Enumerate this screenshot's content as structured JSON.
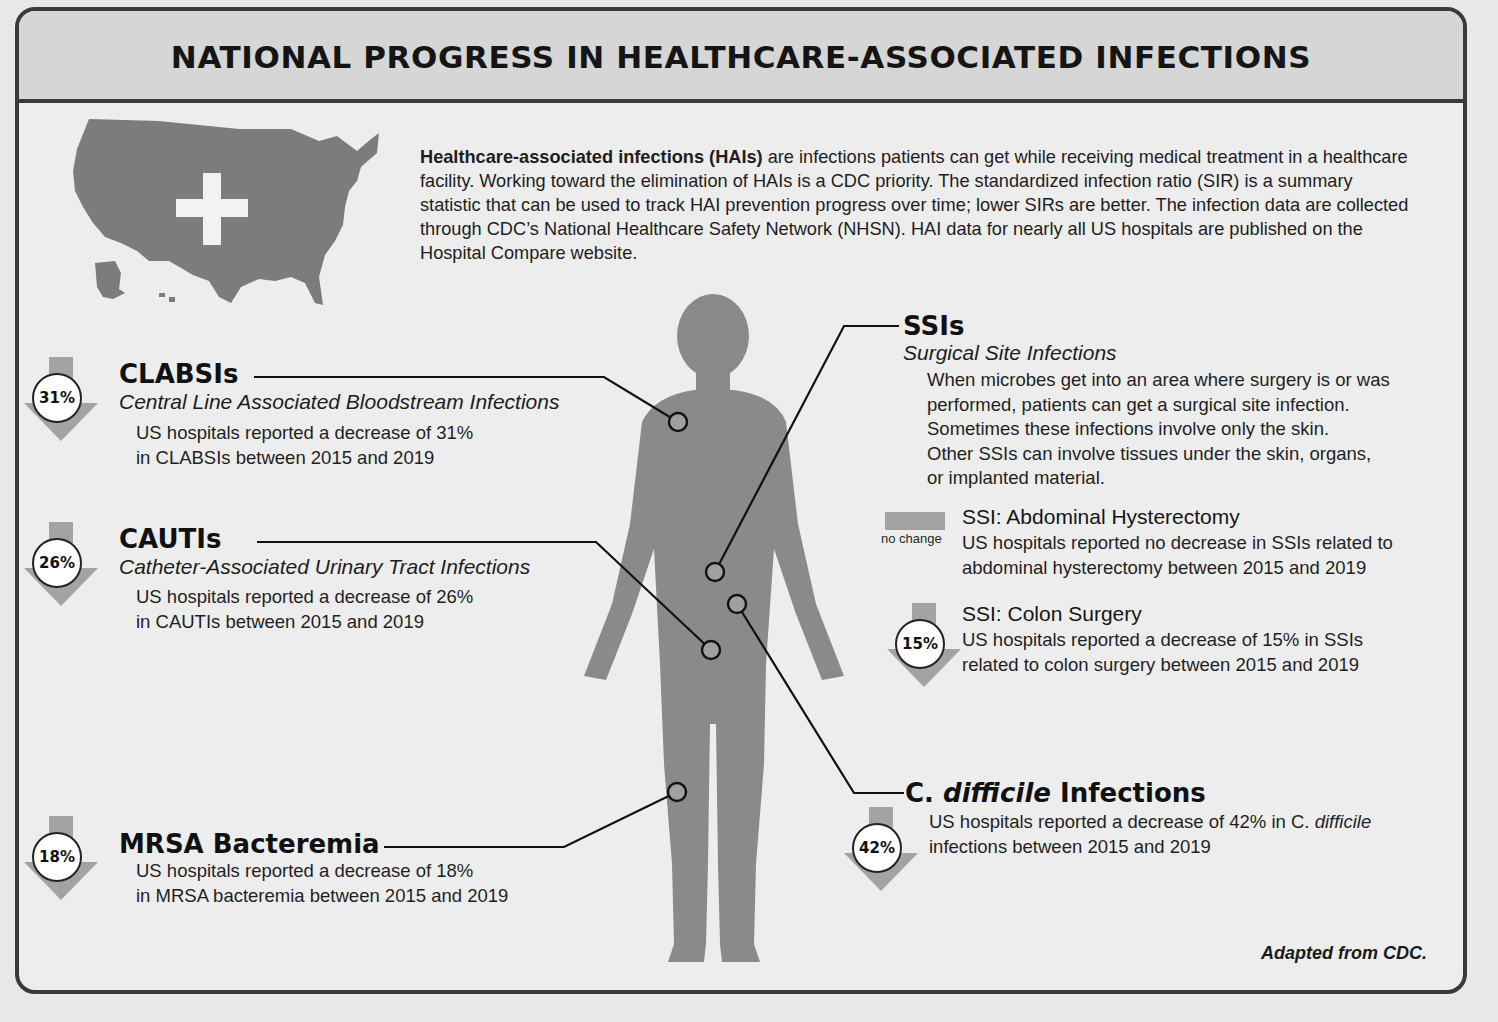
{
  "header": {
    "title": "NATIONAL PROGRESS IN HEALTHCARE-ASSOCIATED INFECTIONS"
  },
  "intro": {
    "lead_bold": "Healthcare-associated infections (HAIs)",
    "text": " are infections patients can get while receiving medical treatment in a healthcare facility. Working toward the elimination of HAIs is a CDC priority. The standardized infection ratio (SIR) is a summary statistic that can be used to track HAI prevention progress over time; lower SIRs are better. The infection data are collected through CDC’s National Healthcare Safety Network (NHSN). HAI data for nearly all US hospitals are published on the Hospital Compare website."
  },
  "icons": {
    "map": "us-map-with-cross",
    "body": "human-silhouette",
    "decrease": "down-arrow",
    "no_change": "flat-bar"
  },
  "colors": {
    "frame": "#3a3a3a",
    "header_bg": "#d6d6d6",
    "panel_bg": "#ededed",
    "silhouette": "#8a8a8a",
    "arrow": "#a3a3a3",
    "text": "#1a1a1a"
  },
  "sections": {
    "clabsi": {
      "badge": "31%",
      "title": "CLABSIs",
      "subtitle": "Central Line Associated Bloodstream Infections",
      "body_line1": "US hospitals reported a decrease of 31%",
      "body_line2": "in CLABSIs between 2015 and 2019"
    },
    "cauti": {
      "badge": "26%",
      "title": "CAUTIs",
      "subtitle": "Catheter-Associated Urinary Tract Infections",
      "body_line1": "US hospitals reported a decrease of 26%",
      "body_line2": "in CAUTIs between 2015 and 2019"
    },
    "mrsa": {
      "badge": "18%",
      "title": "MRSA Bacteremia",
      "body_line1": "US hospitals reported a decrease of 18%",
      "body_line2": "in MRSA bacteremia between 2015 and 2019"
    },
    "ssi": {
      "title": "SSIs",
      "subtitle": "Surgical Site Infections",
      "body_lines": [
        "When microbes get into an area where surgery is or was",
        "performed, patients can get a surgical site infection.",
        "Sometimes these infections involve only the skin.",
        "Other SSIs can involve tissues under the skin, organs,",
        "or implanted material."
      ],
      "hysterectomy": {
        "badge": "no change",
        "title": "SSI: Abdominal Hysterectomy",
        "body_line1": "US hospitals reported no decrease in SSIs related to",
        "body_line2": "abdominal hysterectomy between 2015 and 2019"
      },
      "colon": {
        "badge": "15%",
        "title": "SSI: Colon Surgery",
        "body_line1": "US hospitals reported a decrease of 15% in SSIs",
        "body_line2": "related to colon surgery between 2015 and 2019"
      }
    },
    "cdiff": {
      "badge": "42%",
      "title_prefix": "C. ",
      "title_italic": "difficile",
      "title_suffix": " Infections",
      "body_line1_prefix": "US hospitals reported a decrease of 42% in C. ",
      "body_line1_italic": "difficile",
      "body_line2": "infections between 2015 and 2019"
    }
  },
  "footer": {
    "credit": "Adapted from CDC."
  }
}
